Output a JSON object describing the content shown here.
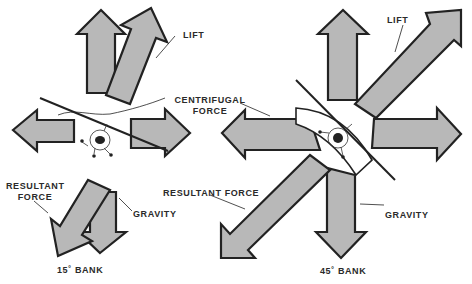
{
  "colors": {
    "arrow_fill": "#b8b8b8",
    "arrow_stroke": "#222222",
    "background": "#ffffff",
    "text": "#2a2a2a"
  },
  "diagram_15": {
    "caption": "15˚ BANK",
    "labels": {
      "lift": "LIFT",
      "centrifugal_line1": "CENTRIFUGAL",
      "centrifugal_line2": "FORCE",
      "resultant_line1": "RESULTANT",
      "resultant_line2": "FORCE",
      "gravity": "GRAVITY"
    }
  },
  "diagram_45": {
    "caption": "45˚ BANK",
    "labels": {
      "lift": "LIFT",
      "resultant": "RESULTANT FORCE",
      "gravity": "GRAVITY"
    }
  }
}
